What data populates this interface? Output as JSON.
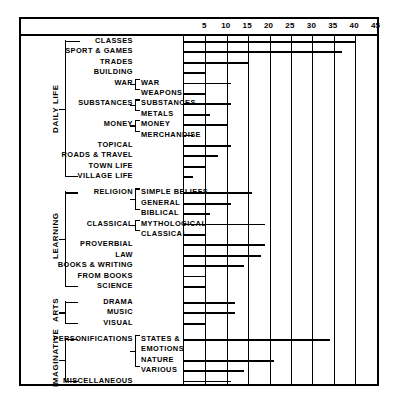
{
  "chart_data": {
    "type": "bar",
    "orientation": "horizontal",
    "title": "",
    "xlabel": "",
    "ylabel": "",
    "xlim": [
      0,
      47
    ],
    "grid": true,
    "gridlines_at": [
      5,
      10,
      15,
      20,
      25,
      30,
      35,
      40,
      45
    ],
    "tick_labels": [
      "5",
      "10",
      "15",
      "20",
      "25",
      "30",
      "35",
      "40",
      "45"
    ],
    "legend": "none",
    "groups": [
      {
        "name": "DAILY LIFE",
        "rows": [
          {
            "level1": "CLASSES",
            "level2": "",
            "value": 40
          },
          {
            "level1": "SPORT & GAMES",
            "level2": "",
            "value": 37
          },
          {
            "level1": "TRADES",
            "level2": "",
            "value": 15
          },
          {
            "level1": "BUILDING",
            "level2": "",
            "value": 5
          },
          {
            "level1": "WAR",
            "level2": "WAR",
            "value": 11
          },
          {
            "level1": "",
            "level2": "WEAPONS",
            "value": 5
          },
          {
            "level1": "SUBSTANCES",
            "level2": "SUBSTANCES",
            "value": 11
          },
          {
            "level1": "",
            "level2": "METALS",
            "value": 6
          },
          {
            "level1": "MONEY",
            "level2": "MONEY",
            "value": 10
          },
          {
            "level1": "",
            "level2": "MERCHANDISE",
            "value": 2
          },
          {
            "level1": "TOPICAL",
            "level2": "",
            "value": 11
          },
          {
            "level1": "ROADS & TRAVEL",
            "level2": "",
            "value": 8
          },
          {
            "level1": "TOWN LIFE",
            "level2": "",
            "value": 5
          },
          {
            "level1": "VILLAGE LIFE",
            "level2": "",
            "value": 2
          }
        ]
      },
      {
        "name": "LEARNING",
        "rows": [
          {
            "level1": "RELIGION",
            "level2": "SIMPLE BELIEFS",
            "value": 16
          },
          {
            "level1": "",
            "level2": "GENERAL",
            "value": 11
          },
          {
            "level1": "",
            "level2": "BIBLICAL",
            "value": 6
          },
          {
            "level1": "CLASSICAL",
            "level2": "MYTHOLOGICAL",
            "value": 19
          },
          {
            "level1": "",
            "level2": "CLASSICAL",
            "value": 5
          },
          {
            "level1": "PROVERBIAL",
            "level2": "",
            "value": 19
          },
          {
            "level1": "LAW",
            "level2": "",
            "value": 18
          },
          {
            "level1": "BOOKS & WRITING",
            "level2": "",
            "value": 14
          },
          {
            "level1": "FROM BOOKS",
            "level2": "",
            "value": 5
          },
          {
            "level1": "SCIENCE",
            "level2": "",
            "value": 5
          }
        ]
      },
      {
        "name": "ARTS",
        "rows": [
          {
            "level1": "DRAMA",
            "level2": "",
            "value": 12
          },
          {
            "level1": "MUSIC",
            "level2": "",
            "value": 12
          },
          {
            "level1": "VISUAL",
            "level2": "",
            "value": 5
          }
        ]
      },
      {
        "name": "IMAGINATIVE",
        "rows": [
          {
            "level1": "PERSONIFICATIONS",
            "level2": "STATES &",
            "value": 34
          },
          {
            "level1": "",
            "level2": "EMOTIONS",
            "value": null
          },
          {
            "level1": "",
            "level2": "NATURE",
            "value": 21
          },
          {
            "level1": "",
            "level2": "VARIOUS",
            "value": 14
          },
          {
            "level1": "MISCELLANEOUS",
            "level2": "",
            "value": 11
          }
        ]
      }
    ]
  }
}
